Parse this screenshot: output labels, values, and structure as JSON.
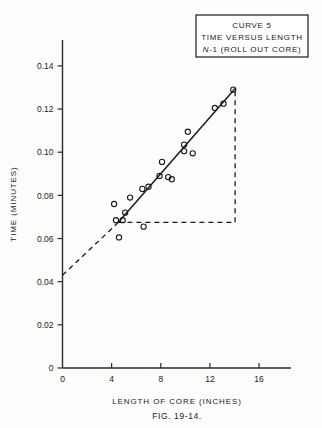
{
  "figure": {
    "caption": "FIG. 19-14.",
    "title_box": {
      "line1": "CURVE 5",
      "line2": "TIME VERSUS LENGTH",
      "line3_italic": "N",
      "line3_rest": "-1 (ROLL OUT CORE)"
    }
  },
  "chart_data": {
    "type": "scatter",
    "title": "CURVE 5 TIME VERSUS LENGTH N-1 (ROLL OUT CORE)",
    "xlabel": "LENGTH OF CORE (INCHES)",
    "ylabel": "TIME (MINUTES)",
    "xlim": [
      0,
      18.6
    ],
    "ylim": [
      0,
      0.152
    ],
    "xticks": [
      0,
      4,
      8,
      12,
      16
    ],
    "xtick_labels": [
      "0",
      "4",
      "8",
      "12",
      "16"
    ],
    "yticks": [
      0,
      0.02,
      0.04,
      0.06,
      0.08,
      0.1,
      0.12,
      0.14
    ],
    "ytick_labels": [
      "0",
      "0.02",
      "0.04",
      "0.06",
      "0.08",
      "0.10",
      "0.12",
      "0.14"
    ],
    "grid": false,
    "legend": null,
    "points": [
      {
        "x": 4.6,
        "y": 0.0605
      },
      {
        "x": 4.35,
        "y": 0.0685
      },
      {
        "x": 4.9,
        "y": 0.0685
      },
      {
        "x": 5.1,
        "y": 0.072
      },
      {
        "x": 4.2,
        "y": 0.076
      },
      {
        "x": 5.5,
        "y": 0.079
      },
      {
        "x": 6.6,
        "y": 0.0655
      },
      {
        "x": 6.5,
        "y": 0.083
      },
      {
        "x": 7.0,
        "y": 0.084
      },
      {
        "x": 7.9,
        "y": 0.089
      },
      {
        "x": 8.6,
        "y": 0.0885
      },
      {
        "x": 8.9,
        "y": 0.0875
      },
      {
        "x": 8.1,
        "y": 0.0955
      },
      {
        "x": 9.9,
        "y": 0.1005
      },
      {
        "x": 9.9,
        "y": 0.1035
      },
      {
        "x": 10.6,
        "y": 0.0995
      },
      {
        "x": 10.2,
        "y": 0.1095
      },
      {
        "x": 12.4,
        "y": 0.1205
      },
      {
        "x": 13.1,
        "y": 0.1225
      },
      {
        "x": 13.9,
        "y": 0.129
      }
    ],
    "fit_line": {
      "style": "solid",
      "x_start": 4.55,
      "y_start": 0.0675,
      "x_end": 14.05,
      "y_end": 0.1295
    },
    "extrapolation_line": {
      "style": "dashed",
      "x_start": 0.0,
      "y_start": 0.043,
      "x_end": 4.55,
      "y_end": 0.0675
    },
    "slope_triangle": {
      "style": "dashed",
      "horizontal_y": 0.0675,
      "horizontal_x_start": 4.55,
      "horizontal_x_end": 14.05,
      "vertical_x": 14.05,
      "vertical_y_start": 0.0675,
      "vertical_y_end": 0.1295
    },
    "y_intercept": 0.043
  }
}
